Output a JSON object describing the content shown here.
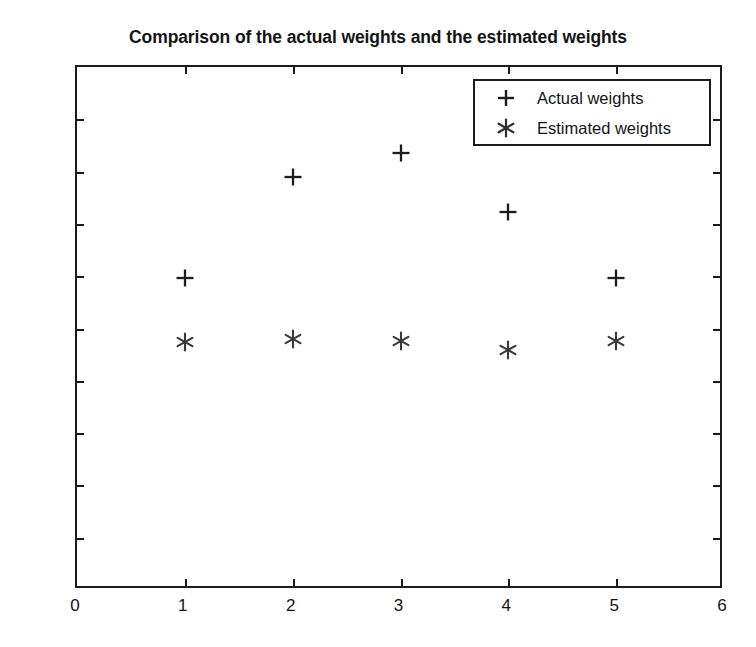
{
  "chart_data": {
    "type": "scatter",
    "title": "Comparison of the actual weights and the estimated weights",
    "xlabel": "",
    "ylabel": "",
    "xlim": [
      0,
      6
    ],
    "ylim": [
      -0.5,
      0.5
    ],
    "grid": false,
    "legend_position": "top-right",
    "x_ticks": [
      "0",
      "1",
      "2",
      "3",
      "4",
      "5",
      "6"
    ],
    "x_tick_values": [
      0,
      1,
      2,
      3,
      4,
      5,
      6
    ],
    "y_ticks": [
      "0.5",
      "0.4",
      "0.3",
      "0.2",
      "0.1",
      "0",
      "-0.1",
      "-0.2",
      "-0.3",
      "-0.4",
      "-0.5"
    ],
    "y_tick_values": [
      0.5,
      0.4,
      0.3,
      0.2,
      0.1,
      0,
      -0.1,
      -0.2,
      -0.3,
      -0.4,
      -0.5
    ],
    "x": [
      1,
      2,
      3,
      4,
      5
    ],
    "series": [
      {
        "name": "Actual weights",
        "marker": "plus",
        "color": "#1c1c1c",
        "values": [
          0.096,
          0.289,
          0.336,
          0.222,
          0.096
        ]
      },
      {
        "name": "Estimated weights",
        "marker": "asterisk",
        "color": "#3a3a3a",
        "values": [
          -0.026,
          -0.021,
          -0.023,
          -0.041,
          -0.024
        ]
      }
    ]
  },
  "legend": {
    "entries": [
      {
        "symbol": "+",
        "label": "Actual weights"
      },
      {
        "symbol": "✳",
        "label": "Estimated weights"
      }
    ]
  }
}
